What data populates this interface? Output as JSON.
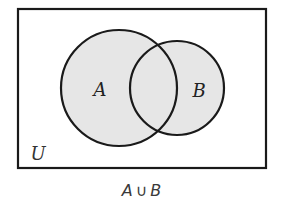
{
  "diagram": {
    "type": "venn",
    "universe": {
      "label": "U",
      "rect": {
        "x": 18,
        "y": 9,
        "width": 248,
        "height": 159
      }
    },
    "sets": [
      {
        "label": "A",
        "cx": 119,
        "cy": 88,
        "r": 58,
        "label_x": 100,
        "label_y": 96
      },
      {
        "label": "B",
        "cx": 177,
        "cy": 88,
        "r": 47,
        "label_x": 199,
        "label_y": 97
      }
    ],
    "shaded_region": "A ∪ B",
    "colors": {
      "outline": "#1a1a1a",
      "shade": "#e6e6e6",
      "background": "#ffffff"
    },
    "caption": {
      "left": "A",
      "operator": "∪",
      "right": "B"
    }
  }
}
